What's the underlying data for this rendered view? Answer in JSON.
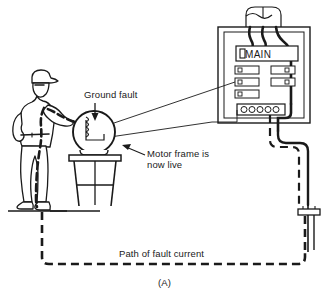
{
  "figure": {
    "caption": "(A)",
    "background_color": "#ffffff",
    "ink_color": "#1a1a1a"
  },
  "labels": {
    "ground_fault": "Ground fault",
    "motor_frame_line1": "Motor frame is",
    "motor_frame_line2": "now live",
    "fault_path": "Path of fault current"
  },
  "panel": {
    "main_breaker_label": "MAIN",
    "branch_breakers": [
      {
        "row": 1,
        "col": "left"
      },
      {
        "row": 1,
        "col": "right"
      },
      {
        "row": 2,
        "col": "left"
      },
      {
        "row": 2,
        "col": "right"
      },
      {
        "row": 3,
        "col": "left"
      }
    ],
    "neutral_bar_terminals": 5,
    "service_entrance_conductors": 3
  },
  "scene": {
    "person": "worker-with-cap-touching-motor",
    "motor": "round-motor-on-stool",
    "motor_winding": "coil",
    "stool_legs": 3,
    "ground_rod": "driven-ground-rod-with-clamp",
    "floor_line": "earth-surface"
  },
  "colors": {
    "ink": "#1a1a1a",
    "paper": "#ffffff",
    "cable_heavy": "#1a1a1a",
    "fault_current_dash": "#1a1a1a"
  }
}
